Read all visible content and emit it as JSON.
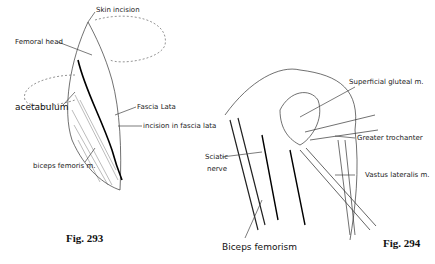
{
  "figures": [
    {
      "caption": "Fig. 293",
      "labels": {
        "skin_incision": "Skin incision",
        "femoral_head": "Femoral head",
        "acetabulum": "acetabulum",
        "fascia_lata": "Fascia Lata",
        "incision_fascia_lata": "incision in fascia lata",
        "biceps_femoris": "biceps femoris m."
      }
    },
    {
      "caption": "Fig. 294",
      "labels": {
        "superficial_gluteal": "Superficial gluteal m.",
        "greater_trochanter": "Greater trochanter",
        "sciatic_nerve_1": "Sciatic",
        "sciatic_nerve_2": "nerve",
        "vastus_lateralis": "Vastus lateralis m.",
        "biceps_femorism": "Biceps femorism"
      }
    }
  ]
}
